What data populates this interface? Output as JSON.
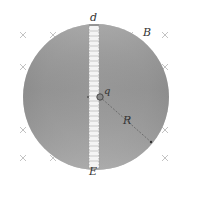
{
  "figure": {
    "labels": {
      "gap_width": "d",
      "magnetic_field": "B",
      "charge": "q",
      "radius": "R",
      "electric_field": "E"
    },
    "colors": {
      "disk_light": "#c4c4c4",
      "disk_dark": "#8a8a8a",
      "cross": "#b8b8b8",
      "gap_fill": "#f4f4f4",
      "gap_dash": "#a8a8a8",
      "text": "#333333"
    },
    "field_marks": {
      "symbol": "×",
      "meaning": "B into page"
    }
  }
}
